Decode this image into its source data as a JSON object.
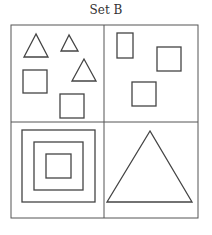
{
  "title": "Set B",
  "grid": {
    "rows": 2,
    "cols": 2,
    "stroke": "#555555"
  },
  "panels": [
    {
      "position": "top-left",
      "shapes": [
        {
          "type": "triangle",
          "size": "medium"
        },
        {
          "type": "triangle",
          "size": "small"
        },
        {
          "type": "triangle",
          "size": "medium"
        },
        {
          "type": "square",
          "size": "medium"
        },
        {
          "type": "square",
          "size": "medium"
        }
      ]
    },
    {
      "position": "top-right",
      "shapes": [
        {
          "type": "rectangle",
          "size": "small"
        },
        {
          "type": "square",
          "size": "medium"
        },
        {
          "type": "square",
          "size": "medium"
        }
      ]
    },
    {
      "position": "bottom-left",
      "shapes": [
        {
          "type": "nested-squares",
          "count": 3
        }
      ]
    },
    {
      "position": "bottom-right",
      "shapes": [
        {
          "type": "triangle",
          "size": "large"
        }
      ]
    }
  ]
}
